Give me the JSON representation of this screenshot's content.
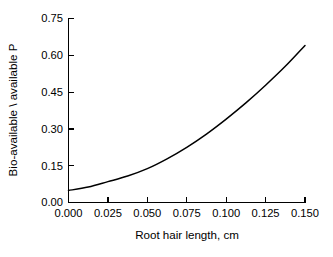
{
  "chart_data": {
    "type": "line",
    "title": "",
    "subtitle": "",
    "xlabel": "Root hair length, cm",
    "ylabel": "Bio-available \\ available P",
    "xlim": [
      0.0,
      0.15
    ],
    "ylim": [
      0.0,
      0.75
    ],
    "grid": false,
    "legend": false,
    "legend_position": "none",
    "xticks": [
      0.0,
      0.025,
      0.05,
      0.075,
      0.1,
      0.125,
      0.15
    ],
    "xticklabels": [
      "0.000",
      "0.025",
      "0.050",
      "0.075",
      "0.100",
      "0.125",
      "0.150"
    ],
    "yticks": [
      0.0,
      0.15,
      0.3,
      0.45,
      0.6,
      0.75
    ],
    "yticklabels": [
      "0.00",
      "0.15",
      "0.30",
      "0.45",
      "0.60",
      "0.75"
    ],
    "series": [
      {
        "name": "Bio-available / available P",
        "color": "#000000",
        "x": [
          0.0,
          0.0125,
          0.025,
          0.0375,
          0.05,
          0.0625,
          0.075,
          0.0875,
          0.1,
          0.1125,
          0.125,
          0.1375,
          0.15
        ],
        "values": [
          0.049,
          0.063,
          0.085,
          0.108,
          0.138,
          0.178,
          0.225,
          0.279,
          0.34,
          0.406,
          0.478,
          0.555,
          0.64
        ]
      }
    ],
    "annotations": []
  },
  "axes": {
    "x_title": "Root hair length, cm",
    "y_title": "Bio-available \\ available P"
  }
}
